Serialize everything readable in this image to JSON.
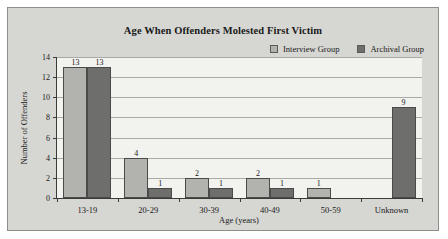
{
  "chart_data": {
    "type": "bar",
    "title": "Age When Offenders Molested First Victim",
    "xlabel": "Age (years)",
    "ylabel": "Number of Offenders",
    "categories": [
      "13-19",
      "20-29",
      "30-39",
      "40-49",
      "50-59",
      "Unknown"
    ],
    "series": [
      {
        "name": "Interview Group",
        "color": "#b2b2ae",
        "values": [
          13,
          4,
          2,
          2,
          1,
          null
        ]
      },
      {
        "name": "Archival Group",
        "color": "#6e6e6c",
        "values": [
          13,
          1,
          1,
          1,
          null,
          9
        ]
      }
    ],
    "ylim": [
      0,
      14
    ],
    "yticks": [
      0,
      2,
      4,
      6,
      8,
      10,
      12,
      14
    ],
    "grid": true,
    "legend_position": "top-right"
  },
  "legend": {
    "entries": [
      {
        "label": "Interview Group"
      },
      {
        "label": "Archival Group"
      }
    ]
  },
  "figure": {
    "background": "#d6d6d2",
    "plot_background": "#f2f2ef",
    "border_color": "#8e8e8a"
  }
}
